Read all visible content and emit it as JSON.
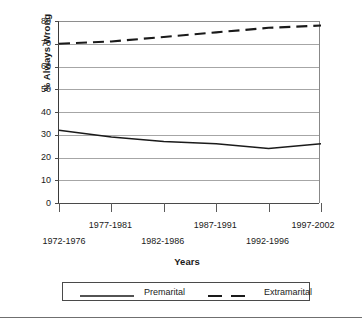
{
  "chart_data": {
    "type": "line",
    "title": "",
    "xlabel": "Years",
    "ylabel": "% Always Wrong",
    "categories": [
      "1972-1976",
      "1977-1981",
      "1982-1986",
      "1987-1991",
      "1992-1996",
      "1997-2002"
    ],
    "yticks": [
      0,
      10,
      20,
      30,
      40,
      50,
      60,
      70,
      80
    ],
    "ylim": [
      0,
      80
    ],
    "grid": true,
    "legend_position": "bottom",
    "series": [
      {
        "name": "Premarital",
        "style": "solid",
        "color": "#1a1a1a",
        "values": [
          32,
          29,
          27,
          26,
          24,
          26
        ]
      },
      {
        "name": "Extramarital",
        "style": "dashed",
        "color": "#1a1a1a",
        "values": [
          70,
          71,
          73,
          75,
          77,
          78
        ]
      }
    ]
  },
  "legend": {
    "entries": [
      {
        "label": "Premarital",
        "style": "solid"
      },
      {
        "label": "Extramarital",
        "style": "dashed"
      }
    ]
  }
}
